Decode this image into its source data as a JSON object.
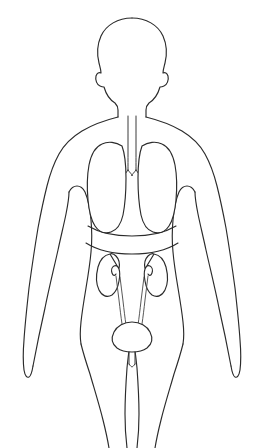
{
  "image": {
    "title": "Human body outline with respiratory and urinary systems",
    "style": "hand-drawn line art",
    "view": "anterior (front) view",
    "background_color": "#ffffff",
    "ink_color": "#2b2b2b",
    "caption_partial": ""
  },
  "figure": {
    "label": "human-body-outline",
    "orientation": "upright, arms at sides",
    "parts": [
      {
        "name": "head",
        "label": "Head"
      },
      {
        "name": "neck",
        "label": "Neck"
      },
      {
        "name": "shoulders",
        "label": "Shoulders"
      },
      {
        "name": "left-arm",
        "label": "Left arm"
      },
      {
        "name": "right-arm",
        "label": "Right arm"
      },
      {
        "name": "torso",
        "label": "Torso"
      },
      {
        "name": "hips",
        "label": "Hips"
      },
      {
        "name": "left-leg",
        "label": "Left leg"
      },
      {
        "name": "right-leg",
        "label": "Right leg"
      }
    ]
  },
  "organs": {
    "respiratory": {
      "label": "Respiratory system",
      "items": [
        {
          "name": "trachea",
          "label": "Trachea"
        },
        {
          "name": "bronchus-left",
          "label": "Left bronchus"
        },
        {
          "name": "bronchus-right",
          "label": "Right bronchus"
        },
        {
          "name": "lung-left",
          "label": "Left lung"
        },
        {
          "name": "lung-right",
          "label": "Right lung"
        }
      ]
    },
    "urinary": {
      "label": "Urinary system",
      "items": [
        {
          "name": "kidney-left",
          "label": "Left kidney"
        },
        {
          "name": "kidney-right",
          "label": "Right kidney"
        },
        {
          "name": "ureter-left",
          "label": "Left ureter"
        },
        {
          "name": "ureter-right",
          "label": "Right ureter"
        },
        {
          "name": "bladder",
          "label": "Urinary bladder"
        },
        {
          "name": "urethra",
          "label": "Urethra"
        }
      ]
    },
    "other": {
      "label": "Other structures",
      "items": [
        {
          "name": "diaphragm-line",
          "label": "Diaphragm / abdominal boundary"
        }
      ]
    }
  }
}
